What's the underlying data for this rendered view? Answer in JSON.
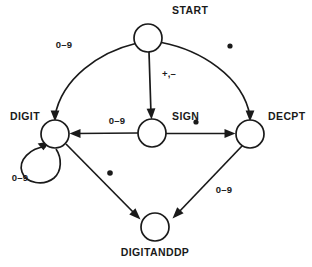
{
  "diagram": {
    "type": "state-transition-diagram",
    "title": "",
    "states": [
      {
        "id": "start",
        "label": "START",
        "cx": 148,
        "cy": 38,
        "r": 14,
        "label_x": 172,
        "label_y": 14,
        "label_anchor": "start"
      },
      {
        "id": "digit",
        "label": "DIGIT",
        "cx": 55,
        "cy": 134,
        "r": 14,
        "label_x": 40,
        "label_y": 120,
        "label_anchor": "end"
      },
      {
        "id": "sign",
        "label": "SIGN",
        "cx": 152,
        "cy": 133,
        "r": 14,
        "label_x": 172,
        "label_y": 120,
        "label_anchor": "start"
      },
      {
        "id": "decpt",
        "label": "DECPT",
        "cx": 250,
        "cy": 134,
        "r": 14,
        "label_x": 268,
        "label_y": 120,
        "label_anchor": "start"
      },
      {
        "id": "digitanddp",
        "label": "DIGITANDDP",
        "cx": 155,
        "cy": 227,
        "r": 14,
        "label_x": 155,
        "label_y": 256,
        "label_anchor": "middle"
      }
    ],
    "transitions": [
      {
        "id": "start-to-digit",
        "from": "START",
        "to": "DIGIT",
        "label": "0–9",
        "label_x": 64,
        "label_y": 48,
        "label_anchor": "middle"
      },
      {
        "id": "start-to-sign",
        "from": "START",
        "to": "SIGN",
        "label": "+,–",
        "label_x": 162,
        "label_y": 77,
        "label_anchor": "start"
      },
      {
        "id": "start-to-decpt",
        "from": "START",
        "to": "DECPT",
        "label": ".",
        "label_x": 230,
        "label_y": 48,
        "label_anchor": "middle",
        "label_is_dot": "yes"
      },
      {
        "id": "sign-to-digit",
        "from": "SIGN",
        "to": "DIGIT",
        "label": "0–9",
        "label_x": 117,
        "label_y": 124,
        "label_anchor": "middle"
      },
      {
        "id": "sign-to-decpt",
        "from": "SIGN",
        "to": "DECPT",
        "label": ".",
        "label_x": 196,
        "label_y": 122,
        "label_anchor": "middle",
        "label_is_dot": "yes"
      },
      {
        "id": "digit-self-loop",
        "from": "DIGIT",
        "to": "DIGIT",
        "label": "0–9",
        "label_x": 20,
        "label_y": 178,
        "label_anchor": "middle"
      },
      {
        "id": "digit-to-digitanddp",
        "from": "DIGIT",
        "to": "DIGITANDDP",
        "label": ".",
        "label_x": 110,
        "label_y": 175,
        "label_anchor": "middle",
        "label_is_dot": "yes"
      },
      {
        "id": "decpt-to-digitanddp",
        "from": "DECPT",
        "to": "DIGITANDDP",
        "label": "0–9",
        "label_x": 224,
        "label_y": 190,
        "label_anchor": "middle"
      }
    ],
    "colors": {
      "stroke": "#1a1a1a",
      "node_fill": "#ffffff",
      "background": "#ffffff"
    }
  }
}
